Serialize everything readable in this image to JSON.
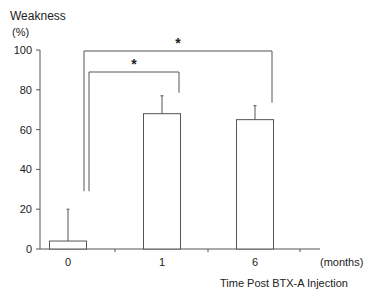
{
  "chart_data": {
    "type": "bar",
    "title": "",
    "ylabel": "Weakness",
    "ylabel_unit": "(%)",
    "xlabel": "Time Post BTX-A Injection",
    "x_unit": "(months)",
    "categories": [
      "0",
      "1",
      "6"
    ],
    "values": [
      4,
      68,
      65
    ],
    "error_upper": [
      20,
      77,
      72
    ],
    "ylim": [
      0,
      100
    ],
    "yticks": [
      0,
      20,
      40,
      60,
      80,
      100
    ],
    "grid": false,
    "significance": [
      {
        "from": "0",
        "to": "1",
        "label": "*"
      },
      {
        "from": "0",
        "to": "6",
        "label": "*"
      }
    ]
  }
}
